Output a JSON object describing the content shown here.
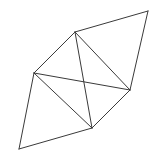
{
  "figure": {
    "background_color": "#ffffff",
    "stroke_color": "#3a3a3a",
    "stroke_width": 1,
    "width": 162,
    "height": 166
  },
  "chart_data": {
    "type": "diagram",
    "subtype": "planar-graph-triangulation",
    "coordinate_system": "pixels, origin top-left",
    "xlim": [
      0,
      162
    ],
    "ylim": [
      0,
      166
    ],
    "grid": false,
    "legend": false,
    "vertex_count": 6,
    "edge_count": 10,
    "vertices": [
      {
        "id": "v1",
        "label": "top-right",
        "x": 148,
        "y": 11
      },
      {
        "id": "v2",
        "label": "apex",
        "x": 75,
        "y": 32
      },
      {
        "id": "v3",
        "label": "left",
        "x": 34,
        "y": 73
      },
      {
        "id": "v4",
        "label": "right",
        "x": 130,
        "y": 90
      },
      {
        "id": "v5",
        "label": "bottom-middle",
        "x": 92,
        "y": 128
      },
      {
        "id": "v6",
        "label": "bottom-left",
        "x": 19,
        "y": 149
      }
    ],
    "edges": [
      {
        "id": "e1",
        "from": "v2",
        "to": "v1",
        "kind": "boundary"
      },
      {
        "id": "e2",
        "from": "v1",
        "to": "v4",
        "kind": "boundary"
      },
      {
        "id": "e3",
        "from": "v2",
        "to": "v4",
        "kind": "internal"
      },
      {
        "id": "e4",
        "from": "v3",
        "to": "v2",
        "kind": "boundary"
      },
      {
        "id": "e5",
        "from": "v3",
        "to": "v4",
        "kind": "internal"
      },
      {
        "id": "e6",
        "from": "v2",
        "to": "v5",
        "kind": "internal"
      },
      {
        "id": "e7",
        "from": "v3",
        "to": "v5",
        "kind": "internal"
      },
      {
        "id": "e8",
        "from": "v4",
        "to": "v5",
        "kind": "boundary"
      },
      {
        "id": "e9",
        "from": "v3",
        "to": "v6",
        "kind": "boundary"
      },
      {
        "id": "e10",
        "from": "v6",
        "to": "v5",
        "kind": "boundary"
      }
    ],
    "crossings": [
      {
        "id": "x1",
        "x": 86,
        "y": 87,
        "between": [
          "e5",
          "e6"
        ]
      }
    ]
  }
}
